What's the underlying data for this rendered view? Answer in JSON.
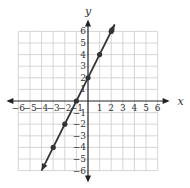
{
  "chart_data": {
    "type": "line",
    "title": "",
    "xlabel": "x",
    "ylabel": "y",
    "xlim": [
      -6,
      6
    ],
    "ylim": [
      -6,
      6
    ],
    "grid": true,
    "x_ticks": [
      -6,
      -5,
      -4,
      -3,
      -2,
      -1,
      1,
      2,
      3,
      4,
      5,
      6
    ],
    "y_ticks": [
      -6,
      -5,
      -4,
      -3,
      -2,
      -1,
      1,
      2,
      3,
      4,
      5,
      6
    ],
    "series": [
      {
        "name": "y = 2x + 2",
        "equation": "y = 2x + 2",
        "slope": 2,
        "intercept": 2,
        "points": [
          [
            -3,
            -4
          ],
          [
            -2,
            -2
          ],
          [
            -1,
            0
          ],
          [
            0,
            2
          ],
          [
            1,
            4
          ],
          [
            2,
            6
          ]
        ],
        "line_extends": [
          [
            -4,
            -6
          ],
          [
            2.3,
            6.6
          ]
        ],
        "arrows_both_ends": true
      }
    ],
    "colors": {
      "grid": "#cccccc",
      "axis": "#222222",
      "line": "#333333"
    }
  }
}
